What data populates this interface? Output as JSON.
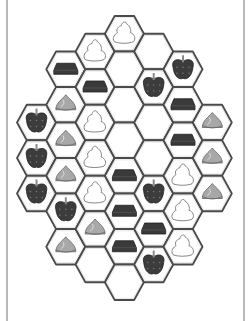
{
  "game": {
    "type": "hex-tile-matching",
    "hex_width": 39,
    "hex_height": 35.5,
    "column_step": 29.3,
    "column_left_x": [
      17,
      46.3,
      75.6,
      104.9,
      134.2,
      163.5,
      192.8
    ],
    "column_top_y": [
      104.75,
      51.5,
      33.75,
      16,
      33.75,
      51.5,
      104.75
    ],
    "columns": [
      [
        "apple",
        "apple",
        "apple"
      ],
      [
        "chocolate",
        "meringue",
        "meringue",
        "meringue",
        "apple",
        "meringue"
      ],
      [
        "cream",
        "chocolate",
        "cream",
        "cream",
        "cream",
        "meringue",
        "empty"
      ],
      [
        "cream",
        "empty",
        "empty",
        "empty",
        "chocolate",
        "chocolate",
        "chocolate",
        "empty"
      ],
      [
        "empty",
        "apple",
        "empty",
        "empty",
        "apple",
        "chocolate",
        "apple"
      ],
      [
        "apple",
        "chocolate",
        "chocolate",
        "cream",
        "cream",
        "cream"
      ],
      [
        "meringue",
        "meringue",
        "meringue"
      ]
    ]
  },
  "colors": {
    "hex_fill": "#ffffff",
    "hex_stroke": "#4a4a4a",
    "hex_stroke_light": "#8c8c8c",
    "apple": "#3c3c3c",
    "apple_stem": "#8a8a8a",
    "chocolate": "#3a3a3a",
    "meringue": "#a8a8a8",
    "cream_outline": "#777777",
    "frame": "#b8b8b8"
  }
}
